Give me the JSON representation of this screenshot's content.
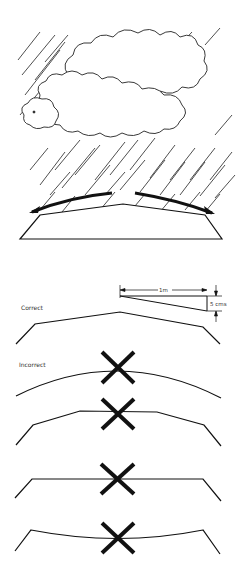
{
  "diagram": {
    "title_panel": "Rain falling on cambered road surface",
    "labels": {
      "correct": "Correct",
      "incorrect": "Incorrect"
    },
    "dimensions": {
      "run": "1m",
      "rise": "5 cms"
    },
    "profiles": [
      {
        "name": "correct-camber",
        "shape": "straight crossfall to crown",
        "status": "correct"
      },
      {
        "name": "curved-crown",
        "shape": "arched curve",
        "status": "incorrect"
      },
      {
        "name": "flat-top-crown",
        "shape": "flat centre with sloped sides",
        "status": "incorrect"
      },
      {
        "name": "flat-profile",
        "shape": "flat level surface",
        "status": "incorrect"
      },
      {
        "name": "sagging-profile",
        "shape": "concave dip in centre",
        "status": "incorrect"
      }
    ],
    "colors": {
      "ink": "#111111",
      "background": "#ffffff"
    }
  }
}
